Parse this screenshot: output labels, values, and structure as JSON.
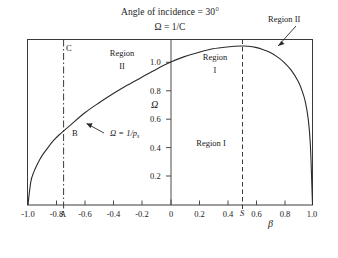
{
  "figure": {
    "title": "Angle of incidence = 30°",
    "subtitle": "Ω = 1/C",
    "background": "#ffffff",
    "line_color": "#2b2b2b"
  },
  "chart_data": {
    "type": "line",
    "title": "Angle of incidence = 30°",
    "subtitle": "Ω = 1/C",
    "xlabel": "β",
    "ylabel": "Ω",
    "xlim": [
      -1.0,
      1.0
    ],
    "ylim": [
      0.0,
      1.17
    ],
    "grid": false,
    "legend": null,
    "xticks": [
      -1.0,
      -0.8,
      -0.6,
      -0.4,
      -0.2,
      0,
      0.2,
      0.4,
      0.6,
      0.8,
      1.0
    ],
    "xticklabels": [
      "-1.0",
      "-0.8",
      "-0.6",
      "-0.4",
      "-0.2",
      "0",
      "0.2",
      "0.4",
      "0.6",
      "0.8",
      "1.0"
    ],
    "yticks": [
      0.2,
      0.4,
      0.6,
      0.8,
      1.0
    ],
    "yticklabels": [
      "0.2",
      "0.4",
      "0.6",
      "0.8",
      "1.0"
    ],
    "series": [
      {
        "name": "Ω = 1/p_s",
        "style": "solid",
        "x": [
          -1.0,
          -0.98,
          -0.96,
          -0.94,
          -0.92,
          -0.9,
          -0.86,
          -0.82,
          -0.78,
          -0.7,
          -0.6,
          -0.5,
          -0.4,
          -0.3,
          -0.2,
          -0.1,
          0.0,
          0.1,
          0.2,
          0.3,
          0.4,
          0.5,
          0.55,
          0.6,
          0.65,
          0.7,
          0.75,
          0.8,
          0.85,
          0.9,
          0.93,
          0.95,
          0.97,
          0.985,
          1.0
        ],
        "y": [
          0.0,
          0.16,
          0.225,
          0.272,
          0.31,
          0.345,
          0.4,
          0.45,
          0.49,
          0.56,
          0.645,
          0.715,
          0.78,
          0.84,
          0.895,
          0.95,
          1.0,
          1.04,
          1.07,
          1.095,
          1.108,
          1.115,
          1.113,
          1.105,
          1.09,
          1.07,
          1.04,
          1.0,
          0.945,
          0.865,
          0.79,
          0.72,
          0.6,
          0.42,
          0.0
        ]
      }
    ],
    "vertical_lines": [
      {
        "name": "line-C-A",
        "x": -0.78,
        "style": "dash-dot",
        "top_label": "C",
        "bottom_label": "A"
      },
      {
        "name": "line-S",
        "x": 0.5,
        "style": "dashed",
        "bottom_label": "S"
      }
    ],
    "annotations": [
      {
        "name": "curve-equation",
        "text": "Ω = 1/p",
        "sub": "s",
        "x": -0.32,
        "y": 0.62
      },
      {
        "name": "point-B",
        "text": "B",
        "x": -0.73,
        "y": 0.51
      },
      {
        "name": "region-II-upper-left",
        "line1": "Region",
        "line2": "II",
        "x": -0.36,
        "y": 1.1
      },
      {
        "name": "region-I-upper-right",
        "line1": "Region",
        "line2": "I",
        "x": 0.31,
        "y": 1.08
      },
      {
        "name": "region-I-lower",
        "text": "Region I",
        "x": 0.17,
        "y": 0.42
      },
      {
        "name": "region-II-callout",
        "text": "Region II",
        "x": 0.77,
        "y": 1.3
      }
    ]
  },
  "labels": {
    "omega_axis": "Ω",
    "beta_axis": "β",
    "region_word": "Region",
    "roman_one": "I",
    "roman_two": "II",
    "region_one_inline": "Region I",
    "region_two_callout": "Region II",
    "point_A": "A",
    "point_B": "B",
    "point_C": "C",
    "point_S": "S",
    "curve_eq_main": "Ω = 1/p",
    "curve_eq_sub": "s"
  },
  "ticks": {
    "x": [
      "-1.0",
      "-0.8",
      "-0.6",
      "-0.4",
      "-0.2",
      "0",
      "0.2",
      "0.4",
      "0.6",
      "0.8",
      "1.0"
    ],
    "y": [
      "1.0",
      "0.8",
      "0.6",
      "0.4",
      "0.2"
    ]
  }
}
